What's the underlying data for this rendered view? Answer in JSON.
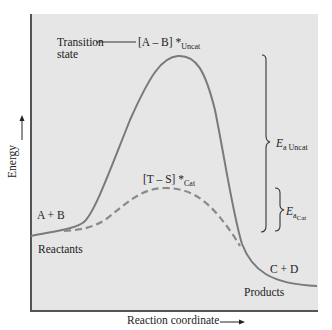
{
  "diagram": {
    "axes": {
      "y_label": "Energy",
      "x_label": "Reaction coordinate"
    },
    "labels": {
      "transition_state_line1": "Transition",
      "transition_state_line2": "state",
      "uncat_complex": "[A – B] *",
      "uncat_sub": "Uncat",
      "cat_complex": "[T – S] *",
      "cat_sub": "Cat",
      "reactants_formula": "A + B",
      "reactants": "Reactants",
      "products_formula": "C + D",
      "products": "Products",
      "ea_uncat_main": "E",
      "ea_uncat_sub": "a Uncat",
      "ea_cat_main": "E",
      "ea_cat_sub": "a",
      "ea_cat_subsub": "Cat"
    },
    "curves": [
      {
        "name": "uncatalyzed",
        "style": "solid",
        "color": "#7a7a7a"
      },
      {
        "name": "catalyzed",
        "style": "dashed",
        "color": "#8a8a8a"
      }
    ],
    "colors": {
      "panel_bg": "#e6e6e6",
      "axis": "#555555",
      "text": "#222222"
    }
  }
}
